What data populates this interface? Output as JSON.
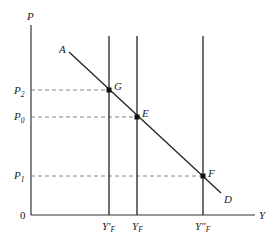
{
  "diagram": {
    "axes": {
      "y_label": "P",
      "x_label": "Y",
      "origin_label": "0"
    },
    "price_levels": [
      {
        "label": "P",
        "sub": "2",
        "y": 90
      },
      {
        "label": "P",
        "sub": "0",
        "y": 117
      },
      {
        "label": "P",
        "sub": "1",
        "y": 176
      }
    ],
    "output_levels": [
      {
        "label": "Y′",
        "sub": "F",
        "x": 109
      },
      {
        "label": "Y",
        "sub": "F",
        "x": 137
      },
      {
        "label": "Y″",
        "sub": "F",
        "x": 203
      }
    ],
    "demand_curve": {
      "start_label": "A",
      "end_label": "D"
    },
    "points": [
      {
        "label": "G",
        "x": 109,
        "y": 90
      },
      {
        "label": "E",
        "x": 137,
        "y": 117
      },
      {
        "label": "F",
        "x": 203,
        "y": 176
      }
    ],
    "colors": {
      "line": "#222222",
      "dashed": "#777777"
    }
  }
}
